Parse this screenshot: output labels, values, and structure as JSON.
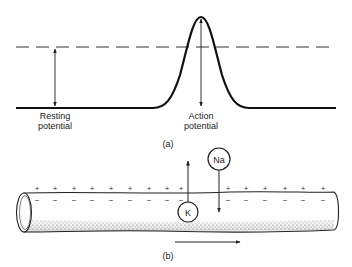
{
  "figure": {
    "panel_a": {
      "caption": "(a)",
      "resting_label_line1": "Resting",
      "resting_label_line2": "potential",
      "action_label_line1": "Action",
      "action_label_line2": "potential"
    },
    "panel_b": {
      "caption": "(b)",
      "ion_k": "K",
      "ion_na": "Na",
      "plus": "+",
      "minus": "−"
    }
  }
}
